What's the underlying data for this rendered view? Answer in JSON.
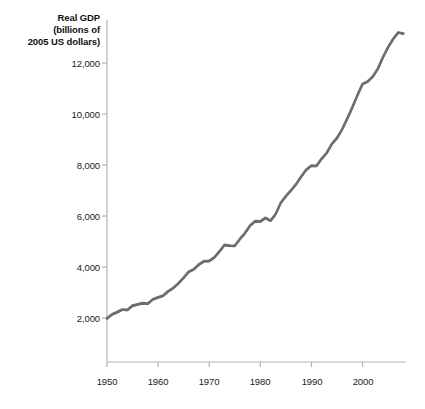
{
  "chart_data": {
    "type": "line",
    "title": "Real GDP (billions of 2005 US dollars)",
    "title_lines": [
      "Real GDP",
      "(billions of",
      "2005 US dollars)"
    ],
    "xlabel": "",
    "ylabel": "Real GDP (billions of 2005 US dollars)",
    "xlim": [
      1950,
      2008.5
    ],
    "ylim": [
      0,
      12800
    ],
    "grid": false,
    "legend": "none",
    "yticks": [
      2000,
      4000,
      6000,
      8000,
      10000,
      12000
    ],
    "ytick_labels": [
      "2,000",
      "4,000",
      "6,000",
      "8,000",
      "10,000",
      "12,000"
    ],
    "xticks": [
      1950,
      1960,
      1970,
      1980,
      1990,
      2000
    ],
    "xtick_labels": [
      "1950",
      "1960",
      "1970",
      "1980",
      "1990",
      "2000"
    ],
    "series": [
      {
        "name": "Real GDP",
        "color": "#6e6e6e",
        "x": [
          1950,
          1951,
          1952,
          1953,
          1954,
          1955,
          1956,
          1957,
          1958,
          1959,
          1960,
          1961,
          1962,
          1963,
          1964,
          1965,
          1966,
          1967,
          1968,
          1969,
          1970,
          1971,
          1972,
          1973,
          1974,
          1975,
          1976,
          1977,
          1978,
          1979,
          1980,
          1981,
          1982,
          1983,
          1984,
          1985,
          1986,
          1987,
          1988,
          1989,
          1990,
          1991,
          1992,
          1993,
          1994,
          1995,
          1996,
          1997,
          1998,
          1999,
          2000,
          2001,
          2002,
          2003,
          2004,
          2005,
          2006,
          2007,
          2008
        ],
        "values": [
          1988,
          2148,
          2234,
          2336,
          2321,
          2485,
          2538,
          2590,
          2568,
          2740,
          2810,
          2880,
          3055,
          3185,
          3368,
          3586,
          3815,
          3915,
          4106,
          4234,
          4240,
          4380,
          4610,
          4870,
          4845,
          4835,
          5100,
          5330,
          5625,
          5800,
          5790,
          5930,
          5820,
          6080,
          6520,
          6780,
          7010,
          7250,
          7550,
          7820,
          7980,
          7970,
          8250,
          8480,
          8830,
          9060,
          9400,
          9820,
          10260,
          10740,
          11180,
          11280,
          11470,
          11780,
          12230,
          12620,
          12950,
          13200,
          13160
        ]
      }
    ],
    "annotations": []
  },
  "chart": {
    "axis_color": "#b4b4b4",
    "line_color": "#6e6e6e",
    "line_shadow_color": "#3d3d3d",
    "background": "#ffffff",
    "tick_text_color": "#1a1a1a"
  }
}
